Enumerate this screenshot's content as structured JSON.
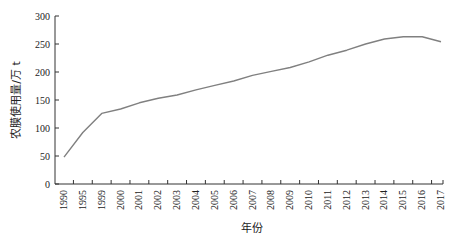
{
  "chart_data": {
    "type": "line",
    "title": "",
    "xlabel": "年份",
    "ylabel": "农膜使用量/万 t",
    "ylim": [
      0,
      300
    ],
    "yticks": [
      0,
      50,
      100,
      150,
      200,
      250,
      300
    ],
    "grid": false,
    "legend": null,
    "categories": [
      "1990",
      "1995",
      "1999",
      "2000",
      "2001",
      "2002",
      "2003",
      "2004",
      "2005",
      "2006",
      "2007",
      "2008",
      "2009",
      "2010",
      "2011",
      "2012",
      "2013",
      "2014",
      "2015",
      "2016",
      "2017"
    ],
    "series": [
      {
        "name": "农膜使用量",
        "color": "#808080",
        "values": [
          48,
          92,
          126,
          134,
          145,
          153,
          159,
          168,
          176,
          184,
          194,
          201,
          208,
          218,
          230,
          239,
          250,
          259,
          263,
          263,
          254
        ]
      }
    ]
  }
}
